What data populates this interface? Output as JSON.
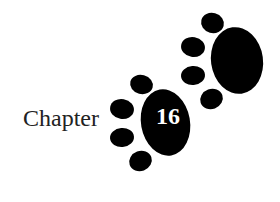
{
  "chapter": {
    "label": "Chapter",
    "number": "16"
  },
  "colors": {
    "paw": "#000000",
    "background": "#ffffff",
    "text": "#222222",
    "number": "#ffffff"
  },
  "icons": [
    "paw-print-icon-upper",
    "paw-print-icon-lower"
  ]
}
